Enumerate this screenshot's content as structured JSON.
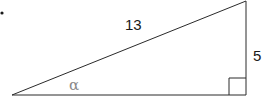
{
  "figure": {
    "type": "right-triangle",
    "bullet": "•",
    "hypotenuse_label": "13",
    "opposite_label": "5",
    "angle_label": "α",
    "colors": {
      "stroke": "#2a2a2a",
      "text": "#1a1a1a",
      "angle_text": "#8a8a8a",
      "background": "#ffffff"
    }
  }
}
